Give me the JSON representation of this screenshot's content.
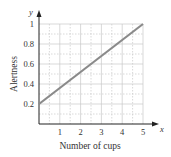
{
  "chart_data": {
    "type": "line",
    "title": "",
    "xlabel": "Number of cups",
    "ylabel": "Alertness",
    "x_axis_var": "x",
    "y_axis_var": "y",
    "xlim": [
      0,
      5
    ],
    "ylim": [
      0,
      1
    ],
    "xticks": [
      "1",
      "2",
      "3",
      "4",
      "5"
    ],
    "yticks": [
      "0.2",
      "0.4",
      "0.6",
      "0.8",
      "1"
    ],
    "grid": true,
    "legend": null,
    "series": [
      {
        "name": "Alertness",
        "x": [
          0,
          5
        ],
        "y": [
          0.2,
          1.0
        ],
        "color": "#8a8a8a"
      }
    ]
  },
  "colors": {
    "line": "#8a8a8a",
    "grid": "#c8c8c8",
    "axis": "#222222"
  }
}
